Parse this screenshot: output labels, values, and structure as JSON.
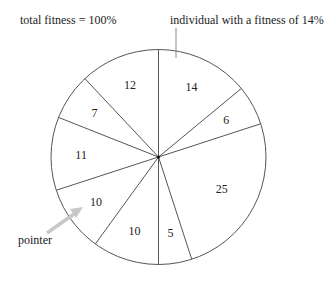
{
  "chart_data": {
    "type": "pie",
    "title": "",
    "categories": [
      "individual 1",
      "individual 2",
      "individual 3",
      "individual 4",
      "individual 5",
      "individual 6",
      "individual 7",
      "individual 8",
      "individual 9"
    ],
    "values": [
      14,
      6,
      25,
      5,
      10,
      10,
      11,
      7,
      12
    ],
    "slice_labels": [
      "14",
      "6",
      "25",
      "5",
      "10",
      "10",
      "11",
      "7",
      "12"
    ],
    "start_angle": "top, clockwise",
    "unit": "%",
    "annotations": [
      {
        "text": "total fitness = 100%",
        "position": "top-left"
      },
      {
        "text": "individual with a fitness of 14%",
        "target_slice": "14",
        "position": "top-right"
      },
      {
        "text": "pointer",
        "target_slice": "10 (left)",
        "position": "bottom-left",
        "arrow": true
      }
    ],
    "legend": "none",
    "grid": false
  },
  "labels": {
    "total": "total fitness = 100%",
    "individual": "individual with a fitness of 14%",
    "pointer": "pointer"
  },
  "colors": {
    "stroke": "#555555",
    "arrow": "#c8c8c8",
    "text": "#222222"
  }
}
